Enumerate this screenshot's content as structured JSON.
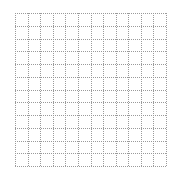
{
  "diagram": {
    "type": "dotted-grid",
    "rows": 12,
    "cols": 12,
    "line_style": "dotted",
    "line_color": "#9a9a9a",
    "background_color": "#ffffff"
  }
}
